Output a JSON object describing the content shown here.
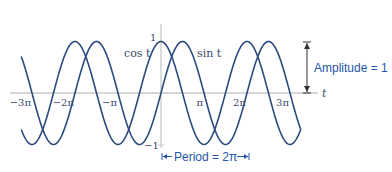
{
  "chart_data": {
    "type": "line",
    "title": "",
    "xlabel": "t",
    "ylabel": "",
    "x_range_pi": [
      -3.25,
      3.25
    ],
    "ylim": [
      -1,
      1
    ],
    "series": [
      {
        "name": "cos t",
        "function": "cos"
      },
      {
        "name": "sin t",
        "function": "sin"
      }
    ],
    "x_ticks": [
      {
        "value_pi": -3,
        "label": "−3π"
      },
      {
        "value_pi": -2,
        "label": "−2π"
      },
      {
        "value_pi": -1,
        "label": "−π"
      },
      {
        "value_pi": 1,
        "label": "π"
      },
      {
        "value_pi": 2,
        "label": "2π"
      },
      {
        "value_pi": 3,
        "label": "3π"
      }
    ],
    "y_ticks": [
      {
        "value": 1,
        "label": "1"
      },
      {
        "value": -1,
        "label": "−1"
      }
    ],
    "annotations": {
      "amplitude": "Amplitude = 1",
      "period": "Period = 2π"
    },
    "colors": {
      "curve": "#2b4a7e",
      "axis": "#c8c8c8",
      "annotation": "#2456a8"
    }
  }
}
